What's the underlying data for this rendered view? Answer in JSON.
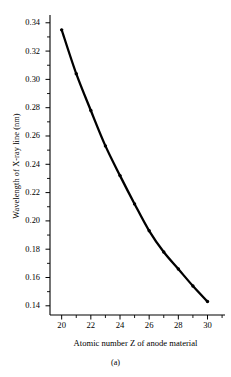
{
  "figure": {
    "caption": "(a)",
    "xlabel": "Atomic number Z of anode material",
    "ylabel": "Wavelength of X-ray line (nm)"
  },
  "chart_data": {
    "type": "line",
    "title": "",
    "subtitle": "",
    "xlabel": "Atomic number Z of anode material",
    "ylabel": "Wavelength of X-ray line (nm)",
    "xlim": [
      19.2,
      31.2
    ],
    "ylim": [
      0.1335,
      0.3455
    ],
    "grid": false,
    "legend": null,
    "marker": "filled-circle",
    "line_color": "#000000",
    "x": [
      20,
      21,
      22,
      23,
      24,
      25,
      26,
      27,
      28,
      29,
      30
    ],
    "y": [
      0.335,
      0.304,
      0.278,
      0.253,
      0.232,
      0.212,
      0.193,
      0.178,
      0.166,
      0.154,
      0.143
    ],
    "series": [
      {
        "name": "K-alpha wavelength",
        "values": [
          0.335,
          0.304,
          0.278,
          0.253,
          0.232,
          0.212,
          0.193,
          0.178,
          0.166,
          0.154,
          0.143
        ]
      }
    ],
    "xticks": [
      20,
      22,
      24,
      26,
      28,
      30
    ],
    "xtick_labels": [
      "20",
      "22",
      "24",
      "26",
      "28",
      "30"
    ],
    "xminor_ticks": [
      21,
      23,
      25,
      27,
      29,
      31
    ],
    "yticks": [
      0.14,
      0.16,
      0.18,
      0.2,
      0.22,
      0.24,
      0.26,
      0.28,
      0.3,
      0.32,
      0.34
    ],
    "ytick_labels": [
      "0.14",
      "0.16",
      "0.18",
      "0.20",
      "0.22",
      "0.24",
      "0.26",
      "0.28",
      "0.30",
      "0.32",
      "0.34"
    ],
    "yminor_ticks": [
      0.15,
      0.17,
      0.19,
      0.21,
      0.23,
      0.25,
      0.27,
      0.29,
      0.31,
      0.33
    ]
  }
}
